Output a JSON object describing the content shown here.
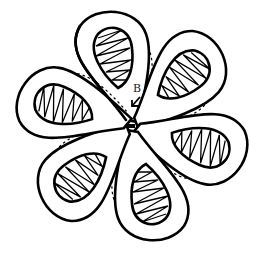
{
  "diagram": {
    "title": "",
    "petal_count": 6,
    "colors": {
      "stroke": "#000000",
      "background": "#ffffff",
      "label": "#222222"
    },
    "labels": [
      {
        "id": "B",
        "text": "B",
        "note": "arrow points to central crossing point"
      }
    ],
    "icons": {
      "pointer": "arrow-down-left-icon"
    }
  }
}
